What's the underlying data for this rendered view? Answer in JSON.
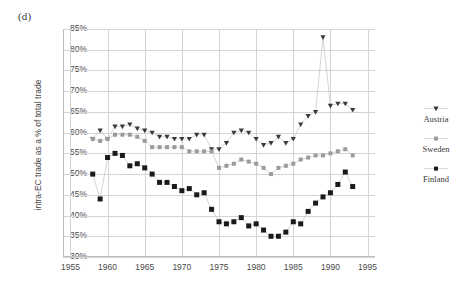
{
  "figure": {
    "panel_label": "(d)",
    "y_axis_title": "intra-EC trade as a % of total trade"
  },
  "legend": {
    "position": "right",
    "entries": [
      {
        "label": "Austria",
        "marker": "triangle-down-marker",
        "color": "#3a3a3a"
      },
      {
        "label": "Sweden",
        "marker": "square-small-marker",
        "color": "#9b9b9b"
      },
      {
        "label": "Finland",
        "marker": "square-filled-marker",
        "color": "#1a1a1a"
      }
    ]
  },
  "chart_data": {
    "type": "line",
    "title": "",
    "xlabel": "",
    "ylabel": "intra-EC trade as a % of total trade",
    "xlim": [
      1954,
      1996
    ],
    "ylim": [
      30,
      85
    ],
    "grid": true,
    "legend_position": "right",
    "xticks": [
      1955,
      1960,
      1965,
      1970,
      1975,
      1980,
      1985,
      1990,
      1995
    ],
    "yticks": [
      30,
      35,
      40,
      45,
      50,
      55,
      60,
      65,
      70,
      75,
      80,
      85
    ],
    "ytick_labels": [
      "30%",
      "35%",
      "40%",
      "45%",
      "50%",
      "55%",
      "60%",
      "65%",
      "70%",
      "75%",
      "80%",
      "85%"
    ],
    "xtick_labels": [
      "1955",
      "1960",
      "1965",
      "1970",
      "1975",
      "1980",
      "1985",
      "1990",
      "1995"
    ],
    "x": [
      1958,
      1959,
      1960,
      1961,
      1962,
      1963,
      1964,
      1965,
      1966,
      1967,
      1968,
      1969,
      1970,
      1971,
      1972,
      1973,
      1974,
      1975,
      1976,
      1977,
      1978,
      1979,
      1980,
      1981,
      1982,
      1983,
      1984,
      1985,
      1986,
      1987,
      1988,
      1989,
      1990,
      1991,
      1992,
      1993
    ],
    "series": [
      {
        "name": "Austria",
        "color": "#3a3a3a",
        "marker": "triangle-down",
        "values": [
          58.5,
          60.5,
          58.5,
          61.5,
          61.5,
          62.0,
          61.0,
          60.5,
          60.0,
          59.0,
          59.0,
          58.5,
          58.5,
          58.5,
          59.5,
          59.5,
          56.0,
          56.0,
          57.5,
          60.0,
          60.5,
          60.0,
          58.5,
          57.0,
          57.5,
          59.0,
          57.5,
          58.5,
          62.0,
          64.0,
          65.0,
          83.0,
          66.5,
          67.0,
          67.0,
          65.5
        ]
      },
      {
        "name": "Sweden",
        "color": "#9b9b9b",
        "marker": "square-small",
        "values": [
          58.5,
          58.0,
          58.5,
          59.5,
          59.5,
          59.5,
          59.0,
          58.0,
          56.5,
          56.5,
          56.5,
          56.5,
          56.5,
          55.5,
          55.5,
          55.5,
          55.5,
          51.5,
          52.0,
          52.5,
          53.5,
          53.0,
          52.5,
          51.5,
          50.0,
          51.5,
          52.0,
          52.5,
          53.5,
          54.0,
          54.5,
          54.5,
          55.0,
          55.5,
          56.0,
          54.5
        ]
      },
      {
        "name": "Finland",
        "color": "#1a1a1a",
        "marker": "square-filled",
        "values": [
          50.0,
          44.0,
          54.0,
          55.0,
          54.5,
          52.0,
          52.5,
          51.5,
          50.0,
          48.0,
          48.0,
          47.0,
          46.0,
          46.5,
          45.0,
          45.5,
          41.5,
          38.5,
          38.0,
          38.5,
          39.5,
          37.5,
          38.0,
          36.5,
          35.0,
          35.0,
          36.0,
          38.5,
          38.0,
          41.0,
          43.0,
          44.5,
          45.5,
          47.5,
          50.5,
          47.0
        ]
      }
    ]
  }
}
